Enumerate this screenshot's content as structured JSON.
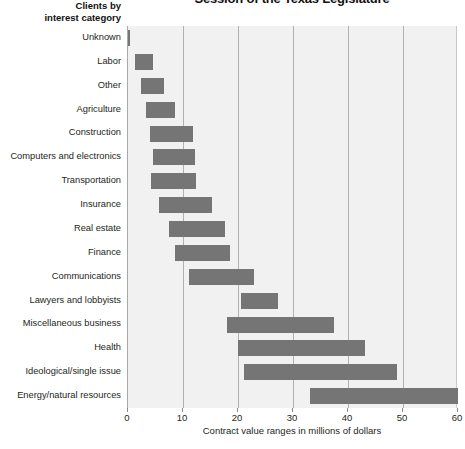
{
  "chart_data": {
    "type": "bar",
    "orientation": "horizontal",
    "bar_style": "range",
    "title": "Session of the Texas Legislature",
    "subtitle": "",
    "ylabel": "Clients by interest category",
    "ylabel_lines": [
      "Clients by",
      "interest category"
    ],
    "xlabel": "Contract value ranges in millions of dollars",
    "xlim": [
      0,
      60
    ],
    "xticks": [
      0,
      10,
      20,
      30,
      40,
      50,
      60
    ],
    "xtick_labels": [
      "0",
      "10",
      "20",
      "30",
      "40",
      "50",
      "60"
    ],
    "grid": true,
    "grid_axis": "x",
    "legend": false,
    "bar_color": "#757575",
    "plot_background": "#f1f1f1",
    "gridline_color": "#b0b0b0",
    "categories": [
      "Unknown",
      "Labor",
      "Other",
      "Agriculture",
      "Construction",
      "Computers and electronics",
      "Transportation",
      "Insurance",
      "Real estate",
      "Finance",
      "Communications",
      "Lawyers and lobbyists",
      "Miscellaneous business",
      "Health",
      "Ideological/single issue",
      "Energy/natural resources"
    ],
    "ranges": [
      {
        "category": "Unknown",
        "low": 0.0,
        "high": 0.4
      },
      {
        "category": "Labor",
        "low": 1.3,
        "high": 4.6
      },
      {
        "category": "Other",
        "low": 2.3,
        "high": 6.5
      },
      {
        "category": "Agriculture",
        "low": 3.2,
        "high": 8.5
      },
      {
        "category": "Construction",
        "low": 4.0,
        "high": 11.8
      },
      {
        "category": "Computers and electronics",
        "low": 4.5,
        "high": 12.2
      },
      {
        "category": "Transportation",
        "low": 4.2,
        "high": 12.4
      },
      {
        "category": "Insurance",
        "low": 5.6,
        "high": 15.2
      },
      {
        "category": "Real estate",
        "low": 7.4,
        "high": 17.6
      },
      {
        "category": "Finance",
        "low": 8.5,
        "high": 18.5
      },
      {
        "category": "Communications",
        "low": 11.1,
        "high": 23.0
      },
      {
        "category": "Lawyers and lobbyists",
        "low": 20.5,
        "high": 27.3
      },
      {
        "category": "Miscellaneous business",
        "low": 18.0,
        "high": 37.5
      },
      {
        "category": "Health",
        "low": 20.0,
        "high": 43.0
      },
      {
        "category": "Ideological/single issue",
        "low": 21.1,
        "high": 49.0
      },
      {
        "category": "Energy/natural resources",
        "low": 33.1,
        "high": 60.0
      }
    ]
  }
}
